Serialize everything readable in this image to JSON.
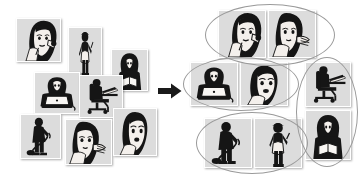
{
  "figure": {
    "type": "concept-diagram",
    "background_color": "#ffffff",
    "tile_background_color": "#d9d9d9",
    "tile_border_color": "#ffffff",
    "ellipse_stroke_color": "#9a9a9a",
    "arrow_color": "#1a1a1a",
    "ink_color": "#101010"
  },
  "left_panel": {
    "name": "unclustered-photo-set",
    "label": "Unclustered photos",
    "tiles": [
      {
        "id": "t1",
        "icon": "woman-eating-icon",
        "label": "Woman eating / snacking",
        "x": 16,
        "y": 18,
        "w": 45,
        "h": 44
      },
      {
        "id": "t2",
        "icon": "woman-standing-icon",
        "label": "Woman standing with apron",
        "x": 68,
        "y": 27,
        "w": 34,
        "h": 50
      },
      {
        "id": "t3",
        "icon": "person-reading-icon",
        "label": "Person reading a book",
        "x": 111,
        "y": 49,
        "w": 37,
        "h": 42
      },
      {
        "id": "t4",
        "icon": "woman-laptop-icon",
        "label": "Woman using a laptop",
        "x": 34,
        "y": 72,
        "w": 46,
        "h": 42
      },
      {
        "id": "t5",
        "icon": "person-desk-chair-icon",
        "label": "Person at desk in office chair",
        "x": 79,
        "y": 75,
        "w": 44,
        "h": 43
      },
      {
        "id": "t6",
        "icon": "person-vacuuming-icon",
        "label": "Person vacuuming",
        "x": 20,
        "y": 114,
        "w": 41,
        "h": 45
      },
      {
        "id": "t7",
        "icon": "woman-skincare-icon",
        "label": "Woman applying skincare",
        "x": 65,
        "y": 119,
        "w": 47,
        "h": 46
      },
      {
        "id": "t8",
        "icon": "woman-phone-icon",
        "label": "Woman talking on phone",
        "x": 113,
        "y": 108,
        "w": 44,
        "h": 48
      }
    ]
  },
  "arrow": {
    "name": "transform-arrow",
    "label": "transforms into",
    "direction": "right",
    "x": 158,
    "y": 83,
    "w": 24,
    "h": 16
  },
  "right_panel": {
    "name": "clustered-photo-set",
    "label": "Clustered photos",
    "clusters": [
      {
        "id": "c1",
        "name": "cluster-beauty-face",
        "label": "Face / beauty cluster",
        "ellipse": {
          "x": 205,
          "y": 4,
          "w": 130,
          "h": 62
        },
        "tiles": [
          {
            "id": "c1t1",
            "icon": "woman-eating-icon",
            "label": "Woman eating / snacking",
            "x": 218,
            "y": 10,
            "w": 48,
            "h": 48
          },
          {
            "id": "c1t2",
            "icon": "woman-skincare-icon",
            "label": "Woman applying skincare",
            "x": 268,
            "y": 10,
            "w": 48,
            "h": 48
          }
        ]
      },
      {
        "id": "c2",
        "name": "cluster-communication",
        "label": "Laptop and phone cluster",
        "ellipse": {
          "x": 183,
          "y": 57,
          "w": 116,
          "h": 54
        },
        "tiles": [
          {
            "id": "c2t1",
            "icon": "woman-laptop-icon",
            "label": "Woman using a laptop",
            "x": 190,
            "y": 62,
            "w": 48,
            "h": 44
          },
          {
            "id": "c2t2",
            "icon": "woman-phone-icon",
            "label": "Woman talking on phone",
            "x": 240,
            "y": 62,
            "w": 48,
            "h": 44
          }
        ]
      },
      {
        "id": "c3",
        "name": "cluster-workspace",
        "label": "Desk and reading cluster",
        "ellipse": {
          "x": 296,
          "y": 57,
          "w": 62,
          "h": 110
        },
        "tiles": [
          {
            "id": "c3t1",
            "icon": "person-desk-chair-icon",
            "label": "Person at desk in office chair",
            "x": 305,
            "y": 62,
            "w": 46,
            "h": 45
          },
          {
            "id": "c3t2",
            "icon": "person-reading-icon",
            "label": "Person reading a book",
            "x": 305,
            "y": 110,
            "w": 46,
            "h": 50
          }
        ]
      },
      {
        "id": "c4",
        "name": "cluster-housework",
        "label": "Housework cluster",
        "ellipse": {
          "x": 196,
          "y": 112,
          "w": 112,
          "h": 62
        },
        "tiles": [
          {
            "id": "c4t1",
            "icon": "person-vacuuming-icon",
            "label": "Person vacuuming",
            "x": 204,
            "y": 118,
            "w": 48,
            "h": 50
          },
          {
            "id": "c4t2",
            "icon": "woman-standing-icon",
            "label": "Woman standing with apron",
            "x": 254,
            "y": 118,
            "w": 48,
            "h": 50
          }
        ]
      }
    ]
  }
}
